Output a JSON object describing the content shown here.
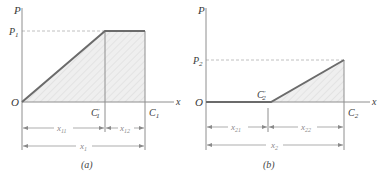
{
  "colors": {
    "axis": "#8e8e8e",
    "curve": "#6b6b6b",
    "hatch_fill": "#ececec",
    "hatch_line": "#d8d8d8",
    "dashed": "#b0b0b0",
    "dim_line": "#8a8a8a"
  },
  "panels": [
    {
      "id": "a",
      "caption": "(a)",
      "y_axis_label": "P",
      "x_axis_label": "x",
      "origin_label": "O",
      "level_label": {
        "base": "P",
        "sub": "1"
      },
      "point_labels": [
        {
          "base": "C",
          "sup": "′",
          "sub": "1"
        },
        {
          "base": "C",
          "sub": "1"
        }
      ],
      "dimensions": [
        {
          "base": "x",
          "sub": "11"
        },
        {
          "base": "x",
          "sub": "12"
        },
        {
          "base": "x",
          "sub": "1"
        }
      ],
      "shape": "linear rise from O to P1 at C1', constant P1 until C1"
    },
    {
      "id": "b",
      "caption": "(b)",
      "y_axis_label": "P",
      "x_axis_label": "x",
      "origin_label": "O",
      "level_label": {
        "base": "P",
        "sub": "2"
      },
      "point_labels": [
        {
          "base": "C",
          "sup": "′",
          "sub": "2"
        },
        {
          "base": "C",
          "sub": "2"
        }
      ],
      "dimensions": [
        {
          "base": "x",
          "sub": "21"
        },
        {
          "base": "x",
          "sub": "22"
        },
        {
          "base": "x",
          "sub": "2"
        }
      ],
      "shape": "zero from O to C2', linear rise to P2 at C2"
    }
  ]
}
